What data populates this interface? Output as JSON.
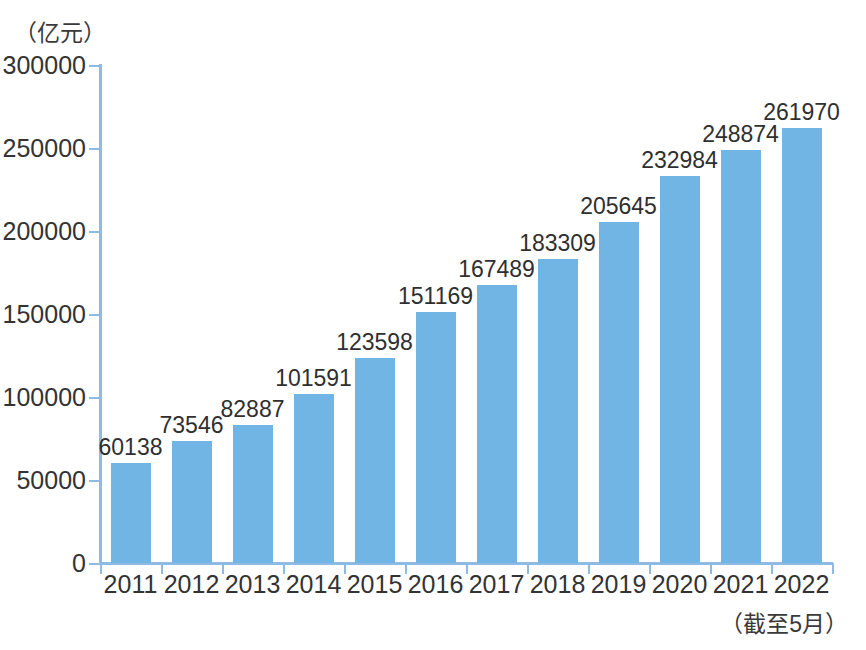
{
  "chart_data": {
    "type": "bar",
    "title": "",
    "subtitle": "",
    "unit_label": "（亿元）",
    "xlabel": "",
    "ylabel": "",
    "footnote": "（截至5月）",
    "categories": [
      "2011",
      "2012",
      "2013",
      "2014",
      "2015",
      "2016",
      "2017",
      "2018",
      "2019",
      "2020",
      "2021",
      "2022"
    ],
    "values": [
      60138,
      73546,
      82887,
      101591,
      123598,
      151169,
      167489,
      183309,
      205645,
      232984,
      248874,
      261970
    ],
    "value_labels": [
      "60138",
      "73546",
      "82887",
      "101591",
      "123598",
      "151169",
      "167489",
      "183309",
      "205645",
      "232984",
      "248874",
      "261970"
    ],
    "ylim": [
      0,
      300000
    ],
    "ytick_values": [
      0,
      50000,
      100000,
      150000,
      200000,
      250000,
      300000
    ],
    "ytick_labels": [
      "0",
      "50000",
      "100000",
      "150000",
      "200000",
      "250000",
      "300000"
    ],
    "grid": false,
    "legend": false,
    "legend_position": "none",
    "colors": {
      "bar": "#70b5e4",
      "axis": "#8dbbe4",
      "text": "#333333",
      "value_text": "#2f2f2f",
      "background": "#ffffff"
    }
  }
}
